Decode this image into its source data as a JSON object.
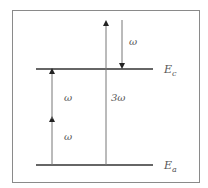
{
  "diagram": {
    "levels": [
      {
        "id": "upper",
        "label_main": "E",
        "label_sub": "c"
      },
      {
        "id": "lower",
        "label_main": "E",
        "label_sub": "a"
      }
    ],
    "arrows": [
      {
        "id": "two-photon-lower-step",
        "direction": "up",
        "label": "ω"
      },
      {
        "id": "two-photon-upper-step",
        "direction": "up",
        "label": "ω"
      },
      {
        "id": "three-photon",
        "direction": "up",
        "label": "3ω"
      },
      {
        "id": "emission",
        "direction": "down",
        "label": "ω"
      }
    ],
    "colors": {
      "frame": "#8a8a8a",
      "level_line": "#333333",
      "arrow": "#666666",
      "text": "#555555"
    }
  }
}
